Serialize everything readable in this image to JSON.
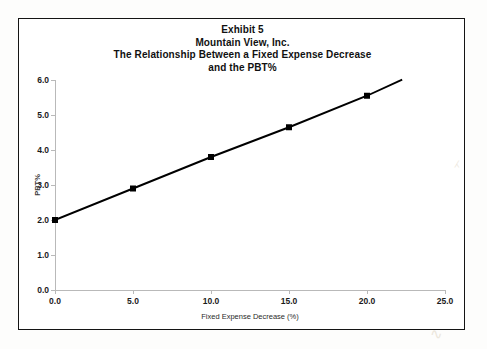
{
  "document": {
    "background_color": "#fdfdfc",
    "frame_color": "#141414"
  },
  "chart_data": {
    "type": "line",
    "title": "Exhibit 5 Mountain View, Inc. The Relationship Between a Fixed Expense Decrease and the PBT%",
    "title_lines": [
      "Exhibit 5",
      "Mountain View, Inc.",
      "The Relationship Between a Fixed Expense Decrease",
      "and the PBT%"
    ],
    "xlabel": "Fixed Expense Decrease (%)",
    "ylabel": "PBT%",
    "xlim": [
      0,
      25
    ],
    "ylim": [
      0,
      6
    ],
    "x_ticks": [
      0,
      5,
      10,
      15,
      20,
      25
    ],
    "y_ticks": [
      0,
      1,
      2,
      3,
      4,
      5,
      6
    ],
    "x_tick_labels": [
      "0.0",
      "5.0",
      "10.0",
      "15.0",
      "20.0",
      "25.0"
    ],
    "y_tick_labels": [
      "0.0",
      "1.0",
      "2.0",
      "3.0",
      "4.0",
      "5.0",
      "6.0"
    ],
    "grid": false,
    "legend": "none",
    "marker": "square",
    "marker_color": "#000000",
    "line_color": "#000000",
    "x": [
      0,
      5,
      10,
      15,
      20
    ],
    "values": [
      2.0,
      2.9,
      3.8,
      4.65,
      5.55
    ],
    "series": [
      {
        "name": "PBT%",
        "x": [
          0,
          5,
          10,
          15,
          20
        ],
        "values": [
          2.0,
          2.9,
          3.8,
          4.65,
          5.55
        ]
      }
    ],
    "line_extends_to": {
      "x": 22.2,
      "y": 6.0
    }
  }
}
